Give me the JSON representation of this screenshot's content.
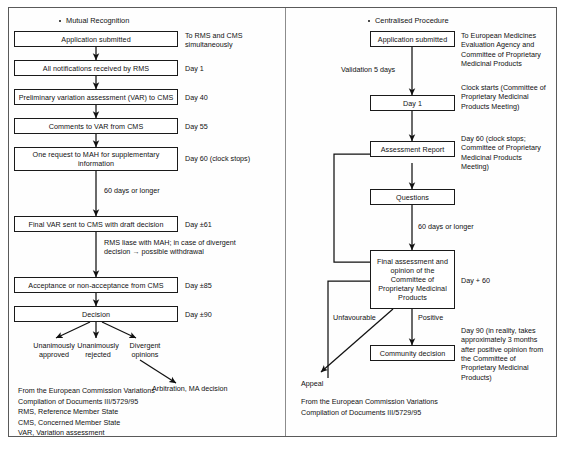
{
  "figure": {
    "panels": [
      {
        "id": "mutual-recognition",
        "title": "Mutual Recognition",
        "nodes": [
          {
            "id": "mr-application",
            "label": "Application submitted"
          },
          {
            "id": "mr-notifications",
            "label": "All notifications received by RMS"
          },
          {
            "id": "mr-prelim-var",
            "label": "Preliminary variation assessment (VAR) to CMS"
          },
          {
            "id": "mr-comments",
            "label": "Comments to VAR from CMS"
          },
          {
            "id": "mr-request-mah",
            "label": "One request to MAH for supplementary information"
          },
          {
            "id": "mr-final-var",
            "label": "Final VAR sent to CMS with draft decision"
          },
          {
            "id": "mr-acceptance",
            "label": "Acceptance or non-acceptance from CMS"
          },
          {
            "id": "mr-decision",
            "label": "Decision"
          }
        ],
        "annotations": [
          {
            "id": "mr-ann-application",
            "text": "To RMS and CMS\nsimultaneously"
          },
          {
            "id": "mr-ann-notifications",
            "text": "Day 1"
          },
          {
            "id": "mr-ann-prelim-var",
            "text": "Day 40"
          },
          {
            "id": "mr-ann-comments",
            "text": "Day 55"
          },
          {
            "id": "mr-ann-request-mah",
            "text": "Day 60 (clock stops)"
          },
          {
            "id": "mr-ann-final-var",
            "text": "Day ±61"
          },
          {
            "id": "mr-ann-acceptance",
            "text": "Day ±85"
          },
          {
            "id": "mr-ann-decision",
            "text": "Day ±90"
          }
        ],
        "edge_labels": [
          {
            "id": "mr-edge-60-days",
            "text": "60 days or longer"
          },
          {
            "id": "mr-edge-rms-liase",
            "text": "RMS liase with MAH; in case of divergent\ndecision → possible withdrawal"
          }
        ],
        "terminals": [
          {
            "id": "mr-term-approved",
            "text": "Unanimously\napproved"
          },
          {
            "id": "mr-term-rejected",
            "text": "Unanimously\nrejected"
          },
          {
            "id": "mr-term-divergent",
            "text": "Divergent\nopinions"
          },
          {
            "id": "mr-term-arbitration",
            "text": "Arbitration, MA decision"
          }
        ],
        "legend": "From the European Commission Variations\nCompilation of Documents III/5729/95\nRMS, Reference Member State\nCMS, Concerned Member State\nVAR, Variation assessment"
      },
      {
        "id": "centralised-procedure",
        "title": "Centralised Procedure",
        "nodes": [
          {
            "id": "cp-application",
            "label": "Application submitted"
          },
          {
            "id": "cp-day1",
            "label": "Day 1"
          },
          {
            "id": "cp-assessment",
            "label": "Assessment Report"
          },
          {
            "id": "cp-questions",
            "label": "Questions"
          },
          {
            "id": "cp-final-assessment",
            "label": "Final assessment and opinion of the Committee of Proprietary Medicinal Products"
          },
          {
            "id": "cp-community-decision",
            "label": "Community decision"
          }
        ],
        "annotations": [
          {
            "id": "cp-ann-application",
            "text": "To European Medicines\nEvaluation Agency and\nCommittee of Proprietary\nMedicinal Products"
          },
          {
            "id": "cp-ann-day1",
            "text": "Clock starts (Committee of\nProprietary Medicinal\nProducts Meeting)"
          },
          {
            "id": "cp-ann-assessment",
            "text": "Day 60 (clock stops;\nCommittee of Proprietary\nMedicinal Products\nMeeting)"
          },
          {
            "id": "cp-ann-final-assessment",
            "text": "Day + 60"
          },
          {
            "id": "cp-ann-community-decision",
            "text": "Day 90 (in reality, takes\napproximately 3 months\nafter positive opinion from\nthe Committee of\nProprietary Medicinal\nProducts)"
          }
        ],
        "edge_labels": [
          {
            "id": "cp-edge-validation",
            "text": "Validation 5 days"
          },
          {
            "id": "cp-edge-60-days",
            "text": "60 days or longer"
          },
          {
            "id": "cp-edge-unfavourable",
            "text": "Unfavourable"
          },
          {
            "id": "cp-edge-positive",
            "text": "Positive"
          }
        ],
        "terminals": [
          {
            "id": "cp-term-appeal",
            "text": "Appeal"
          }
        ],
        "legend": "From the European Commission Variations\nCompilation of Documents III/5729/95"
      }
    ],
    "colors": {
      "ink": "#111111",
      "box_border": "#1a1a1a",
      "frame": "#5a5a5a",
      "background": "#ffffff"
    }
  }
}
